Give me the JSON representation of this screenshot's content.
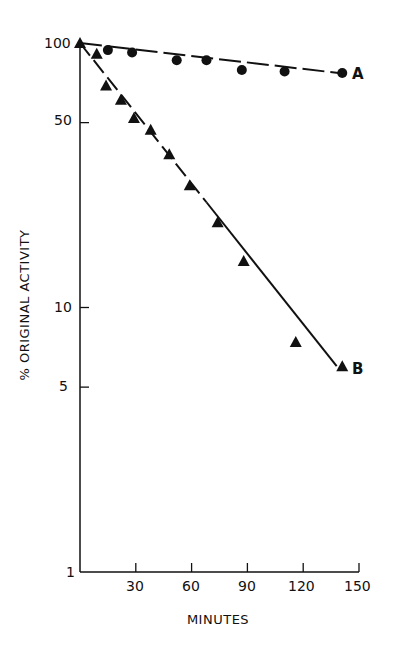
{
  "chart_data": {
    "type": "scatter",
    "title": "",
    "xlabel": "MINUTES",
    "ylabel": "% ORIGINAL ACTIVITY",
    "yscale": "log",
    "xlim": [
      0,
      150
    ],
    "ylim": [
      1,
      100
    ],
    "x_ticks": [
      30,
      60,
      90,
      120,
      150
    ],
    "y_ticks": [
      1,
      5,
      10,
      50,
      100
    ],
    "grid": false,
    "series": [
      {
        "name": "A",
        "marker": "circle",
        "line": "dashed",
        "points": [
          [
            0,
            100
          ],
          [
            15,
            94
          ],
          [
            28,
            92
          ],
          [
            52,
            86
          ],
          [
            68,
            86
          ],
          [
            87,
            79
          ],
          [
            110,
            78
          ],
          [
            141,
            77
          ]
        ],
        "fit_line": [
          [
            0,
            100
          ],
          [
            139,
            77
          ]
        ]
      },
      {
        "name": "B",
        "marker": "triangle",
        "line": "dashed-then-solid",
        "points": [
          [
            0,
            100
          ],
          [
            9,
            91
          ],
          [
            14,
            69
          ],
          [
            22,
            61
          ],
          [
            29,
            52
          ],
          [
            38,
            47
          ],
          [
            48,
            38
          ],
          [
            59,
            29
          ],
          [
            74,
            21
          ],
          [
            88,
            15
          ],
          [
            116,
            7.4
          ],
          [
            141,
            6
          ]
        ],
        "fit_line": [
          [
            0,
            100
          ],
          [
            138,
            6
          ]
        ]
      }
    ]
  },
  "labels": {
    "ylabel": "% ORIGINAL ACTIVITY",
    "xlabel": "MINUTES",
    "series_a": "A",
    "series_b": "B",
    "y_ticks": [
      "100",
      "50",
      "10",
      "5",
      "1"
    ],
    "x_ticks": [
      "30",
      "60",
      "90",
      "120",
      "150"
    ]
  }
}
